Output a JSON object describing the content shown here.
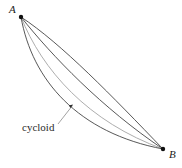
{
  "figure": {
    "background_color": "#ffffff",
    "width": 182,
    "height": 168,
    "endpoints": {
      "a": {
        "label": "A",
        "x": 21,
        "y": 17,
        "dot_radius": 2.2,
        "dot_color": "#111111",
        "label_x": 9,
        "label_y": 13
      },
      "b": {
        "label": "B",
        "x": 163,
        "y": 149,
        "dot_radius": 2.2,
        "dot_color": "#111111",
        "label_x": 169,
        "label_y": 158
      }
    },
    "annotation": {
      "label": "cycloid",
      "label_x": 22,
      "label_y": 131,
      "leader_color": "#8a8a8a",
      "leader_path": "M 58 124 L 72.5 105.5",
      "arrow_x": 73,
      "arrow_y": 104.5
    },
    "curves": [
      {
        "name": "chord-shallow",
        "description": "shallowest arc, closest to straight chord from A to B",
        "color": "#3a3a3a",
        "width": 0.85,
        "path": "M 21 17 C 62 44, 112 96, 163 149"
      },
      {
        "name": "arc-second",
        "description": "second arc, moderately bowed below the chord",
        "color": "#3a3a3a",
        "width": 0.85,
        "path": "M 21 17 C 52 56, 102 108, 163 149"
      },
      {
        "name": "cycloid",
        "description": "the cycloid, the brachistochrone, drawn in light gray",
        "color": "#a9a9a9",
        "width": 0.95,
        "path": "M 21 17 C 42 70, 88 122, 163 149"
      },
      {
        "name": "arc-deepest",
        "description": "deepest arc, bowed furthest below the cycloid",
        "color": "#3a3a3a",
        "width": 0.85,
        "path": "M 21 17 C 32 80, 78 133, 163 149"
      }
    ]
  }
}
